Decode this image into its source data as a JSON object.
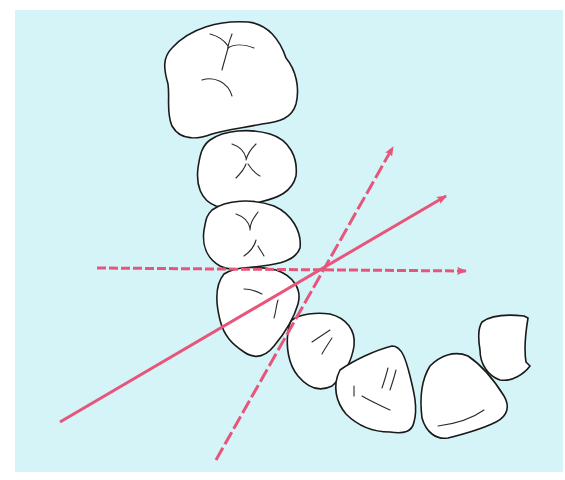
{
  "figure": {
    "colors": {
      "background": "#d4f4f8",
      "tooth_fill": "#ffffff",
      "tooth_outline": "#1a1a1a",
      "arrow": "#e8557a"
    },
    "teeth": [
      {
        "id": "molar",
        "label": ""
      },
      {
        "id": "premolar-2",
        "label": ""
      },
      {
        "id": "premolar-1",
        "label": ""
      },
      {
        "id": "canine",
        "label": ""
      },
      {
        "id": "lateral-incisor",
        "label": ""
      },
      {
        "id": "central-incisor-1",
        "label": ""
      },
      {
        "id": "central-incisor-2",
        "label": ""
      },
      {
        "id": "lateral-incisor-opposite",
        "label": ""
      }
    ],
    "arrows": [
      {
        "id": "horizontal-dashed",
        "style": "dashed",
        "from": [
          97,
          268
        ],
        "to": [
          468,
          271
        ]
      },
      {
        "id": "oblique-solid",
        "style": "solid",
        "from": [
          60,
          422
        ],
        "to": [
          448,
          195
        ]
      },
      {
        "id": "steep-dashed",
        "style": "dashed",
        "from": [
          216,
          460
        ],
        "to": [
          394,
          145
        ]
      }
    ],
    "intersection": [
      325,
      268
    ]
  }
}
